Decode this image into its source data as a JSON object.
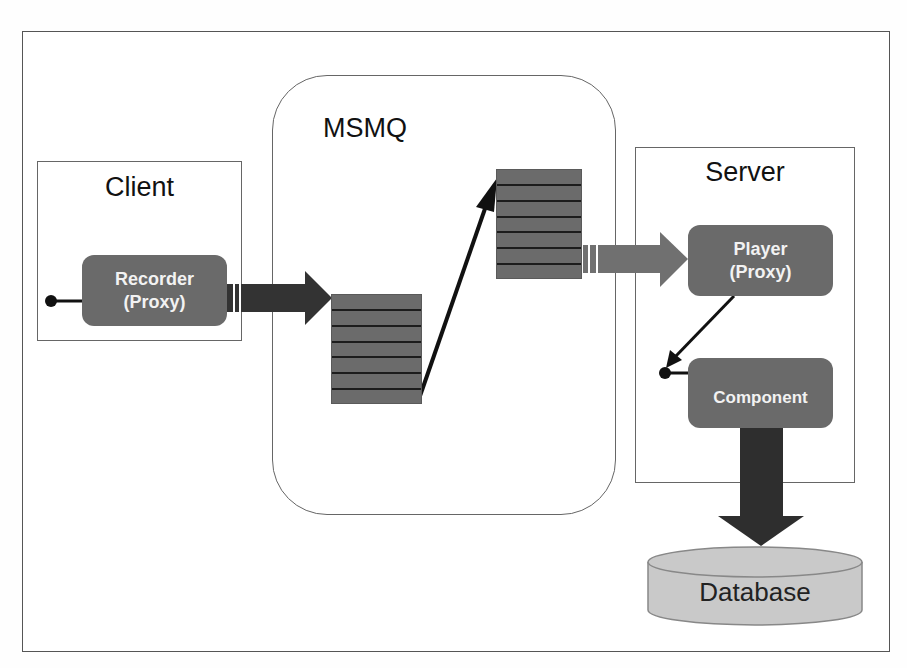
{
  "diagram": {
    "containers": {
      "client": {
        "label": "Client"
      },
      "msmq": {
        "label": "MSMQ"
      },
      "server": {
        "label": "Server"
      }
    },
    "nodes": {
      "recorder": {
        "line1": "Recorder",
        "line2": "(Proxy)"
      },
      "player": {
        "line1": "Player",
        "line2": "(Proxy)"
      },
      "component": {
        "label": "Component"
      },
      "database": {
        "label": "Database"
      }
    },
    "queues": [
      {
        "id": "inbound-queue",
        "slots": 7
      },
      {
        "id": "outbound-queue",
        "slots": 7
      }
    ],
    "colors": {
      "node_fill": "#6a6a6a",
      "node_text": "#f2f2f2",
      "arrow_dark": "#333333",
      "arrow_mid": "#6e6e6e",
      "database_fill": "#c8c8c8",
      "border": "#666666"
    },
    "flows": [
      {
        "from": "recorder",
        "to": "inbound-queue",
        "style": "thick-arrow"
      },
      {
        "from": "inbound-queue",
        "to": "outbound-queue",
        "style": "thin-arrow"
      },
      {
        "from": "outbound-queue",
        "to": "player",
        "style": "thick-arrow"
      },
      {
        "from": "player",
        "to": "component",
        "style": "thin-arrow"
      },
      {
        "from": "component",
        "to": "database",
        "style": "thick-arrow-down"
      }
    ]
  }
}
